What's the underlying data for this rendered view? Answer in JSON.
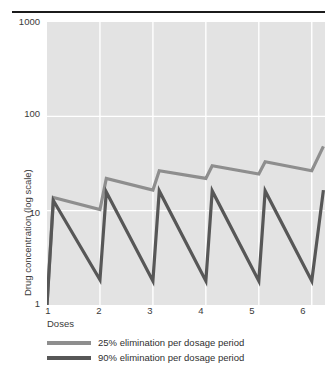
{
  "chart_data": {
    "type": "line",
    "title": "",
    "xlabel": "Doses",
    "ylabel": "Drug concentration (log scale)",
    "yscale": "log",
    "ylim": [
      1,
      1000
    ],
    "ytick_labels": [
      "1000",
      "100",
      "10",
      "1"
    ],
    "ytick_values": [
      1000,
      100,
      10,
      1
    ],
    "xlim": [
      1,
      6.25
    ],
    "xtick_labels": [
      "1",
      "2",
      "3",
      "4",
      "5",
      "6"
    ],
    "xtick_values": [
      1,
      2,
      3,
      4,
      5,
      6
    ],
    "grid": true,
    "legend_position": "below",
    "series": [
      {
        "name": "25% elimination per dosage period",
        "color": "#8e8e8e",
        "x": [
          1.0,
          1.12,
          2.0,
          2.12,
          3.0,
          3.12,
          4.0,
          4.12,
          5.0,
          5.12,
          6.0,
          6.22
        ],
        "y": [
          1.0,
          13.8,
          10.3,
          22.0,
          16.5,
          26.5,
          22.0,
          30.0,
          24.5,
          33.0,
          26.5,
          48.0
        ]
      },
      {
        "name": "90% elimination per dosage period",
        "color": "#575757",
        "x": [
          1.0,
          1.12,
          2.0,
          2.12,
          3.0,
          3.12,
          4.0,
          4.12,
          5.0,
          5.12,
          6.0,
          6.22
        ],
        "y": [
          1.0,
          12.8,
          1.85,
          15.8,
          1.8,
          16.2,
          1.8,
          16.2,
          1.8,
          16.2,
          1.8,
          16.5
        ]
      }
    ],
    "annotations": []
  },
  "axes": {
    "y_title": "Drug concentration (log scale)",
    "x_title": "Doses",
    "y_ticks": [
      {
        "label": "1000",
        "top": 17
      },
      {
        "label": "100",
        "top": 109
      },
      {
        "label": "10",
        "top": 208
      },
      {
        "label": "1",
        "top": 299
      }
    ],
    "x_ticks": [
      {
        "label": "1",
        "left": 38
      },
      {
        "label": "2",
        "left": 89
      },
      {
        "label": "3",
        "left": 140
      },
      {
        "label": "4",
        "left": 191
      },
      {
        "label": "5",
        "left": 242
      },
      {
        "label": "6",
        "left": 293
      }
    ]
  },
  "legend": {
    "items": [
      {
        "label": "25% elimination per dosage period",
        "color": "#8e8e8e"
      },
      {
        "label": "90% elimination per dosage period",
        "color": "#575757"
      }
    ]
  },
  "colors": {
    "plot_background": "#e3e3e3",
    "gridline": "#ffffff",
    "rule": "#1b1b1b",
    "series_light": "#8e8e8e",
    "series_dark": "#575757",
    "text": "#3a3a3a"
  }
}
